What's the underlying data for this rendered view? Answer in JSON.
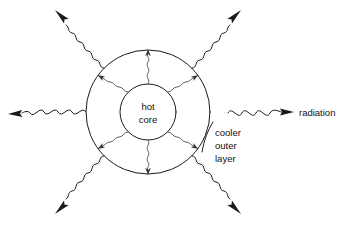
{
  "figure": {
    "name": "star-radiation-cross-section",
    "background_color": "#ffffff",
    "line_color": "#1a1a1a",
    "inner_line_color": "#3a3a3a"
  },
  "labels": {
    "core_line1": "hot",
    "core_line2": "core",
    "outer_line1": "cooler",
    "outer_line2": "outer",
    "outer_line3": "layer",
    "radiation": "radiation"
  },
  "geometry": {
    "center_x": 148,
    "center_y": 112,
    "outer_radius": 62,
    "inner_radius": 28
  },
  "external_rays": [
    {
      "name": "ray-left",
      "direction": "west",
      "has_arrowhead": true,
      "labeled": false
    },
    {
      "name": "ray-right",
      "direction": "east",
      "has_arrowhead": true,
      "labeled": true
    },
    {
      "name": "ray-upper-left",
      "direction": "northwest",
      "has_arrowhead": true,
      "labeled": false
    },
    {
      "name": "ray-upper-right",
      "direction": "northeast",
      "has_arrowhead": true,
      "labeled": false
    },
    {
      "name": "ray-lower-left",
      "direction": "southwest",
      "has_arrowhead": true,
      "labeled": false
    },
    {
      "name": "ray-lower-right",
      "direction": "southeast",
      "has_arrowhead": true,
      "labeled": false
    }
  ],
  "internal_rays": [
    {
      "name": "inner-ray-up",
      "direction": "north",
      "has_arrowhead": true
    },
    {
      "name": "inner-ray-down",
      "direction": "south",
      "has_arrowhead": true
    },
    {
      "name": "inner-ray-upper-left",
      "direction": "northwest",
      "has_arrowhead": true
    },
    {
      "name": "inner-ray-upper-right",
      "direction": "northeast",
      "has_arrowhead": true
    },
    {
      "name": "inner-ray-lower-left",
      "direction": "southwest",
      "has_arrowhead": true
    },
    {
      "name": "inner-ray-lower-right",
      "direction": "southeast",
      "has_arrowhead": true
    }
  ]
}
